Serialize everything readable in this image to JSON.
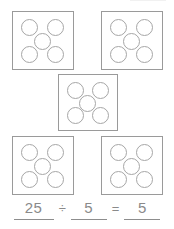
{
  "worksheet": {
    "title": "Division with equal groups",
    "group_count": 5,
    "dots_per_group": 5,
    "total_dots": 25,
    "dot_arrangement": "quincunx",
    "colors": {
      "box_border": "#9a9a9a",
      "dot_border": "#a6a6a6",
      "dot_fill": "#ffffff",
      "text": "#8a8a8a",
      "rule": "#8d8d8d",
      "background": "#ffffff"
    },
    "groups": [
      {
        "id": "group-1",
        "position": "top-left",
        "dot_count": 5,
        "dot_labels": [
          "dot-top-left",
          "dot-top-right",
          "dot-center",
          "dot-bottom-left",
          "dot-bottom-right"
        ]
      },
      {
        "id": "group-2",
        "position": "top-right",
        "dot_count": 5,
        "dot_labels": [
          "dot-top-left",
          "dot-top-right",
          "dot-center",
          "dot-bottom-left",
          "dot-bottom-right"
        ]
      },
      {
        "id": "group-3",
        "position": "middle-center",
        "dot_count": 5,
        "dot_labels": [
          "dot-top-left",
          "dot-top-right",
          "dot-center",
          "dot-bottom-left",
          "dot-bottom-right"
        ]
      },
      {
        "id": "group-4",
        "position": "bottom-left",
        "dot_count": 5,
        "dot_labels": [
          "dot-top-left",
          "dot-top-right",
          "dot-center",
          "dot-bottom-left",
          "dot-bottom-right"
        ]
      },
      {
        "id": "group-5",
        "position": "bottom-right",
        "dot_count": 5,
        "dot_labels": [
          "dot-top-left",
          "dot-top-right",
          "dot-center",
          "dot-bottom-left",
          "dot-bottom-right"
        ]
      }
    ]
  },
  "equation": {
    "dividend": "25",
    "divide_symbol": "÷",
    "divisor": "5",
    "equals_symbol": "=",
    "quotient": "5",
    "full_text": "25 ÷ 5 = 5"
  }
}
